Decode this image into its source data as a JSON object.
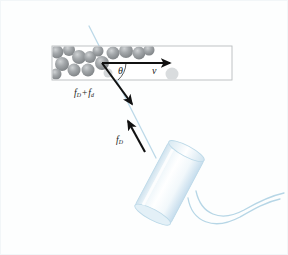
{
  "figure": {
    "background_color": "#fdfefe"
  },
  "vessel": {
    "name": "blood-vessel",
    "fill": "#ffffff",
    "border_color": "#b9bdbf",
    "x": 52,
    "y": 46,
    "width": 180,
    "height": 34,
    "cells": {
      "name": "red-blood-cells",
      "color": "#8f9295",
      "highlight": "#c9ccce",
      "count": 16,
      "positions": [
        {
          "cx": 57,
          "cy": 52,
          "r": 6.5
        },
        {
          "cx": 69,
          "cy": 50,
          "r": 6.0
        },
        {
          "cx": 79,
          "cy": 57,
          "r": 7.0
        },
        {
          "cx": 62,
          "cy": 64,
          "r": 7.0
        },
        {
          "cx": 74,
          "cy": 70,
          "r": 6.5
        },
        {
          "cx": 88,
          "cy": 70,
          "r": 6.5
        },
        {
          "cx": 90,
          "cy": 57,
          "r": 6.0
        },
        {
          "cx": 98,
          "cy": 51,
          "r": 5.5
        },
        {
          "cx": 102,
          "cy": 63,
          "r": 7.0
        },
        {
          "cx": 113,
          "cy": 53,
          "r": 6.5
        },
        {
          "cx": 126,
          "cy": 51,
          "r": 7.0
        },
        {
          "cx": 139,
          "cy": 53,
          "r": 6.5
        },
        {
          "cx": 149,
          "cy": 50,
          "r": 5.5
        },
        {
          "cx": 56,
          "cy": 74,
          "r": 5.5
        },
        {
          "cx": 108,
          "cy": 73,
          "r": 4.5
        },
        {
          "cx": 172,
          "cy": 74,
          "r": 6.5
        }
      ]
    }
  },
  "beam": {
    "name": "ultrasound-beam-line",
    "color": "#bcd9e8",
    "x1": 89,
    "y1": 26,
    "x2": 152,
    "y2": 150
  },
  "vectors": {
    "origin": {
      "x": 102,
      "y": 63
    },
    "velocity": {
      "name": "velocity-vector",
      "label": "v",
      "label_style": "italic",
      "color": "#111111",
      "x1": 102,
      "y1": 63,
      "x2": 168,
      "y2": 63
    },
    "scattered": {
      "name": "scattered-frequency-vector",
      "label_main": "f",
      "label_sub_1": "D",
      "label_plus": "+",
      "label_main_2": "f",
      "label_sub_2": "d",
      "color": "#111111",
      "x1": 102,
      "y1": 63,
      "x2": 130,
      "y2": 102
    },
    "transmitted": {
      "name": "transmitted-frequency-vector",
      "label_main": "f",
      "label_sub": "D",
      "color": "#111111",
      "x1": 143,
      "y1": 148,
      "x2": 129,
      "y2": 123
    },
    "angle": {
      "name": "doppler-angle",
      "label": "θ",
      "arc_radius": 22
    }
  },
  "transducer": {
    "name": "ultrasound-transducer",
    "body_fill_light": "#ffffff",
    "body_fill_mid": "#dbe9f1",
    "edge_color": "#b6d3e2",
    "rotation_deg": 28,
    "x": 150,
    "y": 145,
    "width": 40,
    "height": 75,
    "cable": {
      "name": "transducer-cable",
      "color": "#b6d6e6"
    }
  },
  "labels": {
    "theta": "θ",
    "velocity": "v",
    "f_sum_main": "f",
    "f_sum_sub1": "D",
    "f_sum_plus": "+",
    "f_sum_main2": "f",
    "f_sum_sub2": "d",
    "f_d_main": "f",
    "f_d_sub": "D"
  }
}
